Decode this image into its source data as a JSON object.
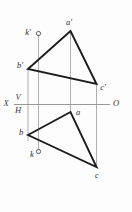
{
  "drawing": {
    "title": "Orthographic projection of triangle ABC with point K",
    "background_color": "#fdfdfd",
    "edge_color": "#1c1c1c",
    "projection_line_color": "#8d8d8d",
    "axis_color": "#8d8d8d",
    "label_color": "#2a2a2a",
    "edge_width": 1.9,
    "thin_width": 0.8
  },
  "ground_line": {
    "name": "XO",
    "y": 104.5,
    "x_start": 14,
    "x_end": 110,
    "left_label": "X",
    "right_label": "O",
    "upper_plane_label": "V",
    "lower_plane_label": "H"
  },
  "labels": {
    "x": "X",
    "o": "O",
    "v": "V",
    "h": "H",
    "a_prime": "a'",
    "b_prime": "b'",
    "c_prime": "c'",
    "k_prime": "k'",
    "a": "a",
    "b": "b",
    "c": "c",
    "k": "k"
  },
  "label_positions": {
    "x": {
      "x": 6,
      "y": 104.5
    },
    "o": {
      "x": 116,
      "y": 104.5
    },
    "v": {
      "x": 18,
      "y": 99
    },
    "h": {
      "x": 18,
      "y": 111
    },
    "a_prime": {
      "x": 69,
      "y": 23.5
    },
    "b_prime": {
      "x": 20,
      "y": 66
    },
    "c_prime": {
      "x": 102,
      "y": 87
    },
    "k_prime": {
      "x": 27,
      "y": 33.5
    },
    "a": {
      "x": 77,
      "y": 113
    },
    "b": {
      "x": 21,
      "y": 133.5
    },
    "c": {
      "x": 97,
      "y": 175
    },
    "k": {
      "x": 32,
      "y": 154.5
    }
  },
  "points": {
    "frontal": {
      "a_prime": {
        "x": 70.5,
        "y": 31
      },
      "b_prime": {
        "x": 28,
        "y": 69
      },
      "c_prime": {
        "x": 96.5,
        "y": 84
      },
      "k_prime": {
        "x": 38.5,
        "y": 33.5
      }
    },
    "horizontal": {
      "a": {
        "x": 70.5,
        "y": 112
      },
      "b": {
        "x": 28,
        "y": 135
      },
      "c": {
        "x": 96.5,
        "y": 167
      },
      "k": {
        "x": 38.5,
        "y": 151.5
      }
    }
  },
  "triangles": [
    {
      "name": "frontal-projection-triangle",
      "vertices": [
        "a_prime",
        "b_prime",
        "c_prime"
      ],
      "path": "M 28,69 L 70.5,31 L 96.5,84 Z"
    },
    {
      "name": "horizontal-projection-triangle",
      "vertices": [
        "a",
        "b",
        "c"
      ],
      "path": "M 28,135 L 70.5,112 L 96.5,167 Z"
    }
  ],
  "projection_lines": [
    {
      "name": "projector-b",
      "x": 28,
      "y1": 69,
      "y2": 141
    },
    {
      "name": "projector-k",
      "x": 38.5,
      "y1": 33.5,
      "y2": 151.5
    },
    {
      "name": "projector-a",
      "x": 70.5,
      "y1": 31,
      "y2": 112
    },
    {
      "name": "projector-c",
      "x": 96.5,
      "y1": 84,
      "y2": 167
    }
  ],
  "point_markers": [
    {
      "name": "k-prime-marker",
      "cx": 38.5,
      "cy": 33.5,
      "r": 2.1
    },
    {
      "name": "k-marker",
      "cx": 38.5,
      "cy": 151.5,
      "r": 2.1
    }
  ]
}
